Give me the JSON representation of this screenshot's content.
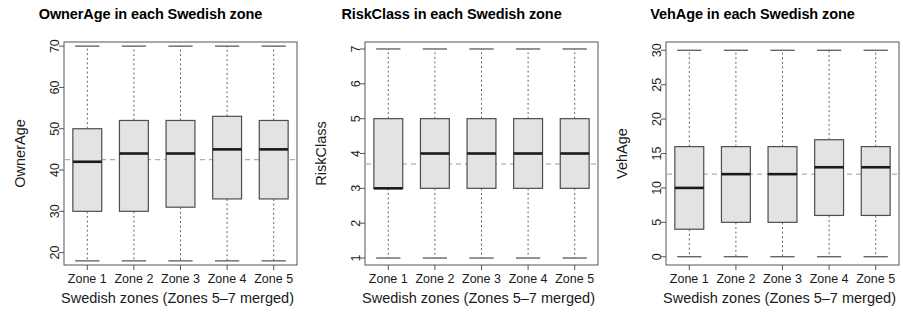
{
  "figure": {
    "panel_count": 3,
    "background_color": "#ffffff",
    "box_fill_color": "#e3e3e3",
    "box_border_color": "#4d4d4d",
    "median_color": "#1a1a1a",
    "whisker_color": "#666666",
    "mean_line_color": "#9a9a9a"
  },
  "chart_data": [
    {
      "type": "boxplot",
      "title": "OwnerAge in each Swedish zone",
      "xlabel": "Swedish zones (Zones 5–7 merged)",
      "ylabel": "OwnerAge",
      "categories": [
        "Zone 1",
        "Zone 2",
        "Zone 3",
        "Zone 4",
        "Zone 5"
      ],
      "ylim": [
        17,
        71
      ],
      "yticks": [
        20,
        30,
        40,
        50,
        60,
        70
      ],
      "yticklabels": [
        "20",
        "30",
        "40",
        "50",
        "60",
        "70"
      ],
      "grid": false,
      "legend": "none",
      "mean_reference_line": 42.5,
      "boxes": [
        {
          "category": "Zone 1",
          "whisker_low": 18,
          "q1": 30,
          "median": 42,
          "q3": 50,
          "whisker_high": 70
        },
        {
          "category": "Zone 2",
          "whisker_low": 18,
          "q1": 30,
          "median": 44,
          "q3": 52,
          "whisker_high": 70
        },
        {
          "category": "Zone 3",
          "whisker_low": 18,
          "q1": 31,
          "median": 44,
          "q3": 52,
          "whisker_high": 70
        },
        {
          "category": "Zone 4",
          "whisker_low": 18,
          "q1": 33,
          "median": 45,
          "q3": 53,
          "whisker_high": 70
        },
        {
          "category": "Zone 5",
          "whisker_low": 18,
          "q1": 33,
          "median": 45,
          "q3": 52,
          "whisker_high": 70
        }
      ]
    },
    {
      "type": "boxplot",
      "title": "RiskClass in each Swedish zone",
      "xlabel": "Swedish zones (Zones 5–7 merged)",
      "ylabel": "RiskClass",
      "categories": [
        "Zone 1",
        "Zone 2",
        "Zone 3",
        "Zone 4",
        "Zone 5"
      ],
      "ylim": [
        0.8,
        7.2
      ],
      "yticks": [
        1,
        2,
        3,
        4,
        5,
        6,
        7
      ],
      "yticklabels": [
        "1",
        "2",
        "3",
        "4",
        "5",
        "6",
        "7"
      ],
      "grid": false,
      "legend": "none",
      "mean_reference_line": 3.7,
      "boxes": [
        {
          "category": "Zone 1",
          "whisker_low": 1,
          "q1": 3,
          "median": 3,
          "q3": 5,
          "whisker_high": 7
        },
        {
          "category": "Zone 2",
          "whisker_low": 1,
          "q1": 3,
          "median": 4,
          "q3": 5,
          "whisker_high": 7
        },
        {
          "category": "Zone 3",
          "whisker_low": 1,
          "q1": 3,
          "median": 4,
          "q3": 5,
          "whisker_high": 7
        },
        {
          "category": "Zone 4",
          "whisker_low": 1,
          "q1": 3,
          "median": 4,
          "q3": 5,
          "whisker_high": 7
        },
        {
          "category": "Zone 5",
          "whisker_low": 1,
          "q1": 3,
          "median": 4,
          "q3": 5,
          "whisker_high": 7
        }
      ]
    },
    {
      "type": "boxplot",
      "title": "VehAge in each Swedish zone",
      "xlabel": "Swedish zones (Zones 5–7 merged)",
      "ylabel": "VehAge",
      "categories": [
        "Zone 1",
        "Zone 2",
        "Zone 3",
        "Zone 4",
        "Zone 5"
      ],
      "ylim": [
        -1.2,
        31.2
      ],
      "yticks": [
        0,
        5,
        10,
        15,
        20,
        25,
        30
      ],
      "yticklabels": [
        "0",
        "5",
        "10",
        "15",
        "20",
        "25",
        "30"
      ],
      "grid": false,
      "legend": "none",
      "mean_reference_line": 12,
      "boxes": [
        {
          "category": "Zone 1",
          "whisker_low": 0,
          "q1": 4,
          "median": 10,
          "q3": 16,
          "whisker_high": 30
        },
        {
          "category": "Zone 2",
          "whisker_low": 0,
          "q1": 5,
          "median": 12,
          "q3": 16,
          "whisker_high": 30
        },
        {
          "category": "Zone 3",
          "whisker_low": 0,
          "q1": 5,
          "median": 12,
          "q3": 16,
          "whisker_high": 30
        },
        {
          "category": "Zone 4",
          "whisker_low": 0,
          "q1": 6,
          "median": 13,
          "q3": 17,
          "whisker_high": 30
        },
        {
          "category": "Zone 5",
          "whisker_low": 0,
          "q1": 6,
          "median": 13,
          "q3": 16,
          "whisker_high": 30
        }
      ]
    }
  ]
}
